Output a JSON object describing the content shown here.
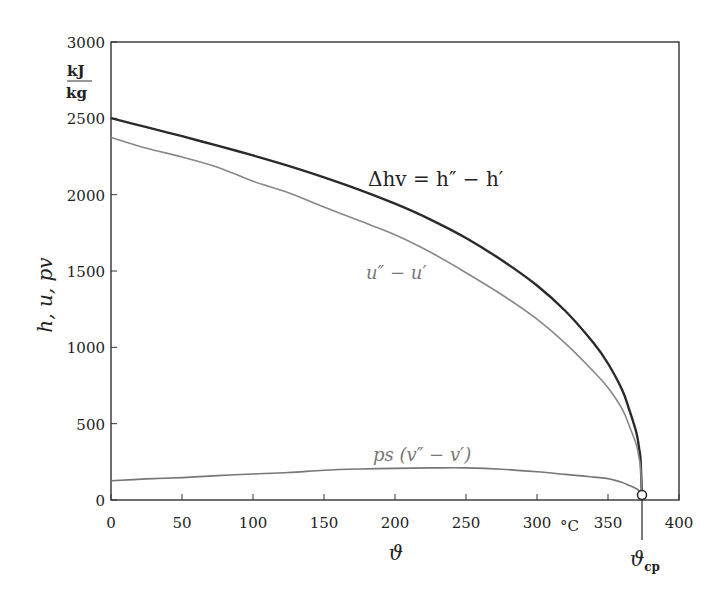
{
  "chart_data": {
    "type": "line",
    "title": "",
    "xlabel": "ϑ",
    "xunit": "°C",
    "ylabel": "h, u, pv",
    "yunit_num": "kJ",
    "yunit_den": "kg",
    "xlim": [
      0,
      400
    ],
    "ylim": [
      0,
      3000
    ],
    "xticks": [
      0,
      50,
      100,
      150,
      200,
      250,
      300,
      350,
      400
    ],
    "yticks": [
      0,
      500,
      1000,
      1500,
      2000,
      2500,
      3000
    ],
    "grid": false,
    "legend": "none (inline annotations)",
    "critical_point": {
      "label": "ϑcp",
      "x": 373.95,
      "y": 0
    },
    "annotations": [
      {
        "text": "Δhv = h″ − h′",
        "series": "delta_h"
      },
      {
        "text": "u″ − u′",
        "series": "delta_u"
      },
      {
        "text": "ps (v″ − v′)",
        "series": "p_delta_v"
      }
    ],
    "x": [
      0,
      25,
      50,
      75,
      100,
      125,
      150,
      175,
      200,
      225,
      250,
      275,
      300,
      320,
      340,
      350,
      360,
      365,
      370,
      372,
      373,
      373.95
    ],
    "series": [
      {
        "name": "Δhv = h″ − h′",
        "color": "#2a2a2a",
        "width": 2.4,
        "values": [
          2501,
          2442,
          2383,
          2321,
          2257,
          2189,
          2114,
          2032,
          1941,
          1837,
          1716,
          1572,
          1405,
          1238,
          1027,
          894,
          720,
          590,
          441,
          333,
          252,
          0
        ]
      },
      {
        "name": "u″ − u′",
        "color": "#888888",
        "width": 1.6,
        "values": [
          2375,
          2304,
          2247,
          2180,
          2088,
          2013,
          1919,
          1829,
          1738,
          1623,
          1489,
          1346,
          1184,
          1026,
          840,
          735,
          595,
          485,
          360,
          270,
          205,
          0
        ]
      },
      {
        "name": "ps (v″ − v′)",
        "color": "#777777",
        "width": 1.6,
        "values": [
          126,
          138,
          147,
          160,
          170,
          180,
          195,
          203,
          207,
          210,
          210,
          202,
          185,
          168,
          150,
          140,
          115,
          95,
          74,
          60,
          47,
          0
        ]
      }
    ]
  }
}
